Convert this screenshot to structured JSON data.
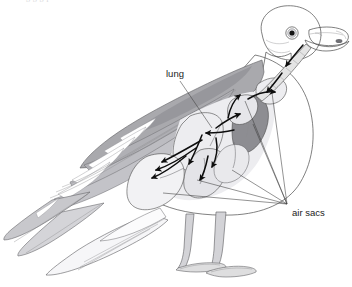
{
  "figure": {
    "clipped_header_text": "g g g p",
    "background_color": "#ffffff"
  },
  "labels": [
    {
      "id": "lung",
      "text": "lung",
      "x": 166,
      "y": 77,
      "anchor": "start",
      "leader": {
        "x1": 180,
        "y1": 81,
        "x2": 212,
        "y2": 128
      }
    },
    {
      "id": "air-sacs",
      "text": "air sacs",
      "x": 292,
      "y": 216,
      "anchor": "start",
      "convergence": {
        "x": 287,
        "y": 204
      }
    }
  ],
  "air_sac_leaders": [
    {
      "x1": 287,
      "y1": 204,
      "x2": 163,
      "y2": 193
    },
    {
      "x1": 287,
      "y1": 204,
      "x2": 197,
      "y2": 180
    },
    {
      "x1": 287,
      "y1": 204,
      "x2": 232,
      "y2": 170
    },
    {
      "x1": 287,
      "y1": 204,
      "x2": 253,
      "y2": 124
    },
    {
      "x1": 287,
      "y1": 204,
      "x2": 245,
      "y2": 101
    },
    {
      "x1": 287,
      "y1": 204,
      "x2": 272,
      "y2": 93
    }
  ],
  "colors": {
    "outline_stroke": "#4a4a4a",
    "mantle_gray": "#a9a9ad",
    "mantle_dark_gray": "#97979c",
    "lung_dark_gray": "#8d8d92",
    "air_sac_light": "#ededf0",
    "air_sac_mid": "#dcdce0",
    "body_white": "#fbfbfc",
    "leg_gray": "#d3d3d7",
    "arrow_black": "#0d0d0d",
    "label_text": "#1b1b1b",
    "feather_shade": "#b8b8bc"
  },
  "anatomy_parts": [
    {
      "name": "head",
      "fill": "#fdfdfd"
    },
    {
      "name": "eye",
      "fill": "#141414"
    },
    {
      "name": "beak",
      "fill": "#e6e6ea"
    },
    {
      "name": "trachea",
      "fill": "#e2e2e6"
    },
    {
      "name": "mantle-back",
      "fill": "#a9a9ad"
    },
    {
      "name": "wing-coverts",
      "fill": "#b8b8bc"
    },
    {
      "name": "primary-feathers",
      "fill": "#c6c6ca"
    },
    {
      "name": "tail",
      "fill": "#f2f2f4"
    },
    {
      "name": "breast-belly",
      "fill": "#fbfbfc"
    },
    {
      "name": "lung",
      "fill": "#8d8d92"
    },
    {
      "name": "cervical-air-sac",
      "fill": "#ededf0"
    },
    {
      "name": "clavicular-air-sac",
      "fill": "#e6e6ea"
    },
    {
      "name": "anterior-thoracic-air-sac",
      "fill": "#ededf0"
    },
    {
      "name": "posterior-thoracic-air-sac",
      "fill": "#e4e4e8"
    },
    {
      "name": "abdominal-air-sac",
      "fill": "#ededf0"
    },
    {
      "name": "legs",
      "fill": "#d3d3d7"
    },
    {
      "name": "webbed-feet",
      "fill": "#dededf"
    }
  ],
  "airflow_arrows": [
    {
      "id": "trachea-down-1",
      "description": "down the trachea from beak"
    },
    {
      "id": "trachea-down-2",
      "description": "lower trachea into body"
    },
    {
      "id": "into-clavicular",
      "description": "into clavicular air sac"
    },
    {
      "id": "into-cervical",
      "description": "upward into cervical air sac"
    },
    {
      "id": "into-lung-left",
      "description": "leftward into lung"
    },
    {
      "id": "lung-to-anterior",
      "description": "from lung to anterior sac"
    },
    {
      "id": "down-to-abdominal",
      "description": "downward into abdominal sac"
    },
    {
      "id": "out-to-posterior",
      "description": "out to posterior thoracic sac"
    },
    {
      "id": "forward-lower",
      "description": "forward along lower body"
    }
  ]
}
